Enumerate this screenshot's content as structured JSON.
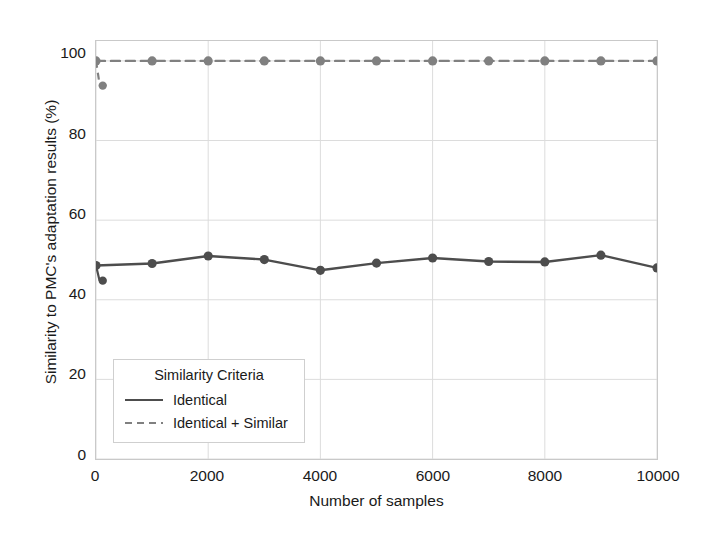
{
  "chart_data": {
    "type": "line",
    "title": "",
    "xlabel": "Number of samples",
    "ylabel": "Similarity to PMC's adaptation results (%)",
    "xlim": [
      0,
      10000
    ],
    "ylim": [
      0,
      105
    ],
    "xticks": [
      0,
      2000,
      4000,
      6000,
      8000,
      10000
    ],
    "xtick_labels": [
      "0",
      "2000",
      "4000",
      "6000",
      "8000",
      "10000"
    ],
    "yticks": [
      0,
      20,
      40,
      60,
      80,
      100
    ],
    "ytick_labels": [
      "0",
      "20",
      "40",
      "60",
      "80",
      "100"
    ],
    "grid": true,
    "legend_position": "lower left",
    "legend_title": "Similarity Criteria",
    "x": [
      0,
      1000,
      2000,
      3000,
      4000,
      5000,
      6000,
      7000,
      8000,
      9000,
      10000
    ],
    "series": [
      {
        "name": "Identical",
        "style": "solid",
        "marker": "circle",
        "color": "#4d4d4d",
        "values": [
          48.6,
          49.1,
          51.0,
          50.1,
          47.4,
          49.2,
          50.5,
          49.6,
          49.5,
          51.2,
          48.0
        ],
        "leading_dip": {
          "x": [
            0,
            60,
            120
          ],
          "values": [
            48.6,
            45.0,
            44.8
          ],
          "note": "short drop at the very start of the axis"
        }
      },
      {
        "name": "Identical + Similar",
        "style": "dashed",
        "marker": "circle",
        "color": "#808080",
        "values": [
          100,
          100,
          100,
          100,
          100,
          100,
          100,
          100,
          100,
          100,
          100
        ],
        "leading_dip": {
          "x": [
            0,
            60,
            120
          ],
          "values": [
            100,
            94.5,
            93.8
          ],
          "note": "short drop at the very start of the axis"
        }
      }
    ]
  },
  "legend": {
    "title": "Similarity Criteria",
    "entries": [
      {
        "label": "Identical",
        "style": "solid"
      },
      {
        "label": "Identical + Similar",
        "style": "dashed"
      }
    ]
  },
  "colors": {
    "identical_line": "#4d4d4d",
    "identical_similar_line": "#808080",
    "grid": "#dcdcdc",
    "frame": "#c9c9c9",
    "text": "#1a1a1a",
    "background": "#ffffff"
  }
}
